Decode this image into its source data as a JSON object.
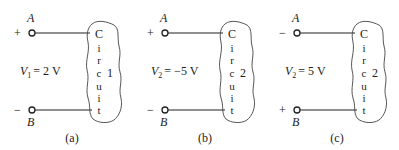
{
  "panels": [
    {
      "id": "a",
      "caption": "(a)",
      "terminal_top": {
        "label": "A",
        "polarity": "+"
      },
      "terminal_bottom": {
        "label": "B",
        "polarity": "−"
      },
      "voltage": {
        "symbol": "V",
        "subscript": "1",
        "value": "= 2 V"
      },
      "circuit": {
        "letters": [
          "C",
          "i",
          "r",
          "c",
          "u",
          "i",
          "t"
        ],
        "number": "1"
      }
    },
    {
      "id": "b",
      "caption": "(b)",
      "terminal_top": {
        "label": "A",
        "polarity": "+"
      },
      "terminal_bottom": {
        "label": "B",
        "polarity": "−"
      },
      "voltage": {
        "symbol": "V",
        "subscript": "2",
        "value": "= −5 V"
      },
      "circuit": {
        "letters": [
          "C",
          "i",
          "r",
          "c",
          "u",
          "i",
          "t"
        ],
        "number": "2"
      }
    },
    {
      "id": "c",
      "caption": "(c)",
      "terminal_top": {
        "label": "A",
        "polarity": "−"
      },
      "terminal_bottom": {
        "label": "B",
        "polarity": "+"
      },
      "voltage": {
        "symbol": "V",
        "subscript": "2",
        "value": "= 5 V"
      },
      "circuit": {
        "letters": [
          "C",
          "i",
          "r",
          "c",
          "u",
          "i",
          "t"
        ],
        "number": "2"
      }
    }
  ]
}
